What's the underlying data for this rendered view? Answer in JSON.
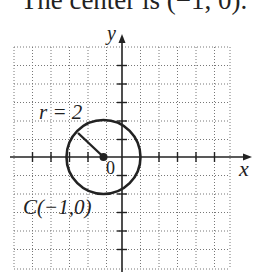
{
  "caption": "The center is (−1, 0).",
  "diagram": {
    "axes": {
      "x_label": "x",
      "y_label": "y"
    },
    "origin_label": "0",
    "radius_label": "r = 2",
    "center_label": "C(−1,0)",
    "circle": {
      "center": [
        -1,
        0
      ],
      "radius": 2
    },
    "grid": {
      "x_range": [
        -6,
        6
      ],
      "y_range": [
        -6,
        6
      ],
      "style": "dotted"
    },
    "colors": {
      "stroke": "#222222",
      "grid": "#777777"
    }
  }
}
